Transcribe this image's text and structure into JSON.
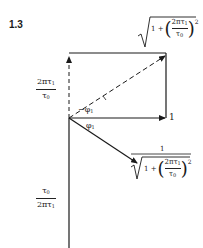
{
  "figure": {
    "label": "1.3",
    "stroke_color": "#1a1a1a"
  },
  "vectors": {
    "horizontal_label": "1",
    "angle_neg": "−φ",
    "angle_neg_sub": "1",
    "angle_pos": "φ",
    "angle_pos_sub": "1"
  },
  "left_labels": {
    "upper": {
      "num_a": "2πτ",
      "num_sub": "1",
      "den": "τ",
      "den_sub": "0"
    },
    "lower": {
      "num": "τ",
      "num_sub": "0",
      "den_a": "2πτ",
      "den_sub": "1"
    }
  },
  "top_magnitude": {
    "prefix": "1 +",
    "inner_num": "2πτ",
    "inner_num_sub": "1",
    "inner_den": "τ",
    "inner_den_sub": "0",
    "exponent": "2"
  },
  "bottom_magnitude": {
    "numerator": "1",
    "prefix": "1 +",
    "inner_num": "2πτ",
    "inner_num_sub": "1",
    "inner_den": "τ",
    "inner_den_sub": "0",
    "exponent": "2"
  }
}
